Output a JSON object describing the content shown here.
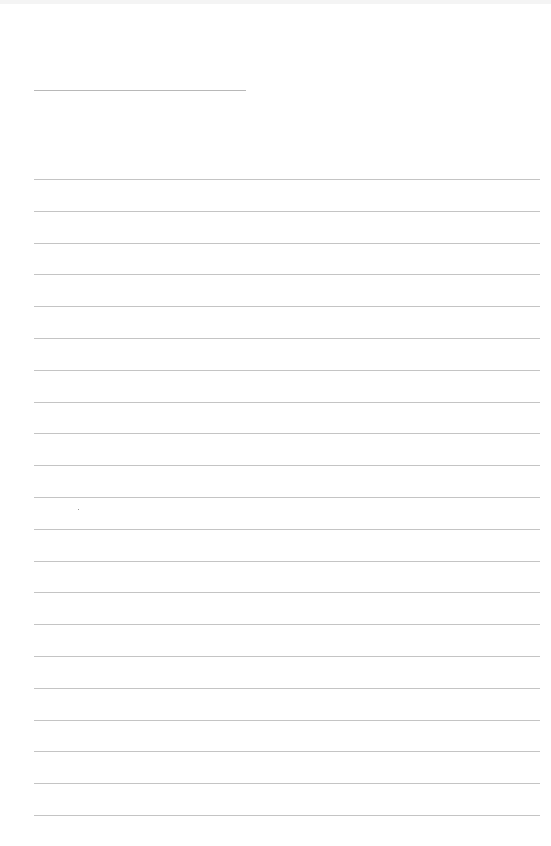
{
  "document": {
    "type": "blank lined sheet",
    "header_line": {
      "x": 34,
      "y": 90,
      "width": 212
    },
    "ruled_lines": {
      "count": 21,
      "start_y": 179,
      "spacing": 31.8,
      "x": 34,
      "width": 506
    },
    "colors": {
      "background": "#ffffff",
      "line": "#c4c4c4"
    }
  }
}
